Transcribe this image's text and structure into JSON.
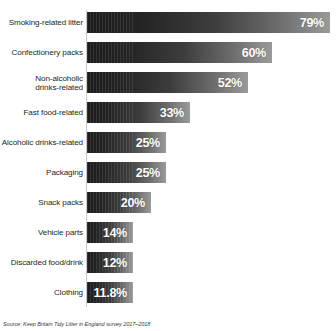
{
  "chart_data": {
    "type": "bar",
    "orientation": "horizontal",
    "title": "",
    "xlabel": "",
    "ylabel": "",
    "xlim": [
      0,
      79
    ],
    "grid": false,
    "legend": false,
    "categories": [
      "Smoking-related litter",
      "Confectionery packs",
      "Non-alcoholic\ndrinks-related",
      "Fast food-related",
      "Alcoholic drinks-related",
      "Packaging",
      "Snack packs",
      "Vehicle parts",
      "Discarded food/drink",
      "Clothing"
    ],
    "values": [
      79,
      60,
      52,
      33,
      25,
      25,
      20,
      14,
      12,
      11.8
    ],
    "value_labels": [
      "79%",
      "60%",
      "52%",
      "33%",
      "25%",
      "25%",
      "20%",
      "14%",
      "12%",
      "11.8%"
    ],
    "bars": [
      {
        "label": "Smoking-related litter",
        "value": 79,
        "value_label": "79%",
        "bar_width_px": 243,
        "top_px": 4
      },
      {
        "label": "Confectionery packs",
        "value": 60,
        "value_label": "60%",
        "bar_width_px": 185,
        "top_px": 34
      },
      {
        "label": "Non-alcoholic\ndrinks-related",
        "value": 52,
        "value_label": "52%",
        "bar_width_px": 161,
        "top_px": 64
      },
      {
        "label": "Fast food-related",
        "value": 33,
        "value_label": "33%",
        "bar_width_px": 103,
        "top_px": 94
      },
      {
        "label": "Alcoholic drinks-related",
        "value": 25,
        "value_label": "25%",
        "bar_width_px": 79,
        "top_px": 124
      },
      {
        "label": "Packaging",
        "value": 25,
        "value_label": "25%",
        "bar_width_px": 79,
        "top_px": 154
      },
      {
        "label": "Snack packs",
        "value": 20,
        "value_label": "20%",
        "bar_width_px": 64,
        "top_px": 184
      },
      {
        "label": "Vehicle parts",
        "value": 14,
        "value_label": "14%",
        "bar_width_px": 46,
        "top_px": 214
      },
      {
        "label": "Discarded food/drink",
        "value": 12,
        "value_label": "12%",
        "bar_width_px": 46,
        "top_px": 244
      },
      {
        "label": "Clothing",
        "value": 11.8,
        "value_label": "11.8%",
        "bar_width_px": 46,
        "top_px": 274
      }
    ],
    "colors": {
      "bar_dark": "#1b1b1b",
      "bar_light": "#9a9a9a",
      "value_text": "#ffffff",
      "label_text": "#231f20",
      "axis_line": "#c9c9c9",
      "background": "#ffffff"
    }
  },
  "source": {
    "text": "Source: Keep Britain Tidy Litter in England survey 2017–2018"
  }
}
